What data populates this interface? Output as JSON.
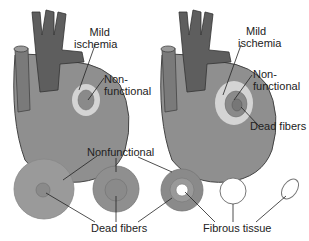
{
  "diagram": {
    "top_left": {
      "labels": {
        "mild_ischemia_1": "Mild",
        "mild_ischemia_2": "ischemia",
        "nonfunctional_1": "Non-",
        "nonfunctional_2": "functional"
      }
    },
    "top_right": {
      "labels": {
        "mild_ischemia_1": "Mild",
        "mild_ischemia_2": "ischemia",
        "nonfunctional_1": "Non-",
        "nonfunctional_2": "functional",
        "dead_fibers": "Dead fibers"
      }
    },
    "bottom": {
      "labels": {
        "nonfunctional": "Nonfunctional",
        "dead_fibers": "Dead fibers",
        "fibrous_tissue": "Fibrous tissue"
      }
    },
    "colors": {
      "heart": "#8c8c8c",
      "vessels": "#5e5e5e",
      "nonfunctional": "#8f8f8f",
      "ischemia": "#d4d4d4",
      "dead": "#7a7a7a",
      "outline": "#444444"
    }
  }
}
